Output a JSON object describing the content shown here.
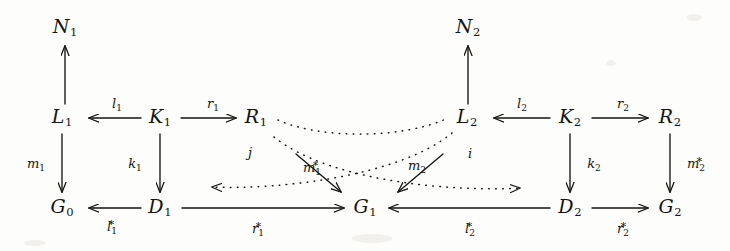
{
  "diagram": {
    "type": "commutative-diagram",
    "title": "",
    "nodes": [
      {
        "id": "N1",
        "label": "N",
        "sub": "1",
        "x": 65,
        "y": 28
      },
      {
        "id": "N2",
        "label": "N",
        "sub": "2",
        "x": 468,
        "y": 28
      },
      {
        "id": "L1",
        "label": "L",
        "sub": "1",
        "x": 62,
        "y": 118
      },
      {
        "id": "K1",
        "label": "K",
        "sub": "1",
        "x": 160,
        "y": 118
      },
      {
        "id": "R1",
        "label": "R",
        "sub": "1",
        "x": 256,
        "y": 118
      },
      {
        "id": "L2",
        "label": "L",
        "sub": "2",
        "x": 467,
        "y": 118
      },
      {
        "id": "K2",
        "label": "K",
        "sub": "2",
        "x": 570,
        "y": 118
      },
      {
        "id": "R2",
        "label": "R",
        "sub": "2",
        "x": 670,
        "y": 118
      },
      {
        "id": "G0",
        "label": "G",
        "sub": "0",
        "x": 62,
        "y": 208
      },
      {
        "id": "D1",
        "label": "D",
        "sub": "1",
        "x": 160,
        "y": 208
      },
      {
        "id": "G1",
        "label": "G",
        "sub": "1",
        "x": 365,
        "y": 208
      },
      {
        "id": "D2",
        "label": "D",
        "sub": "2",
        "x": 570,
        "y": 208
      },
      {
        "id": "G2",
        "label": "G",
        "sub": "2",
        "x": 670,
        "y": 208
      }
    ],
    "edges": [
      {
        "id": "L1-N1",
        "from": "L1",
        "to": "N1",
        "style": "solid",
        "label": "",
        "sub": "",
        "star": false
      },
      {
        "id": "L2-N2",
        "from": "L2",
        "to": "N2",
        "style": "solid",
        "label": "",
        "sub": "",
        "star": false
      },
      {
        "id": "K1-L1",
        "from": "K1",
        "to": "L1",
        "style": "solid",
        "label": "l",
        "sub": "1",
        "star": false
      },
      {
        "id": "K1-R1",
        "from": "K1",
        "to": "R1",
        "style": "solid",
        "label": "r",
        "sub": "1",
        "star": false
      },
      {
        "id": "K2-L2",
        "from": "K2",
        "to": "L2",
        "style": "solid",
        "label": "l",
        "sub": "2",
        "star": false
      },
      {
        "id": "K2-R2",
        "from": "K2",
        "to": "R2",
        "style": "solid",
        "label": "r",
        "sub": "2",
        "star": false
      },
      {
        "id": "L1-G0",
        "from": "L1",
        "to": "G0",
        "style": "solid",
        "label": "m",
        "sub": "1",
        "star": false
      },
      {
        "id": "K1-D1",
        "from": "K1",
        "to": "D1",
        "style": "solid",
        "label": "k",
        "sub": "1",
        "star": false
      },
      {
        "id": "K2-D2",
        "from": "K2",
        "to": "D2",
        "style": "solid",
        "label": "k",
        "sub": "2",
        "star": false
      },
      {
        "id": "R2-G2",
        "from": "R2",
        "to": "G2",
        "style": "solid",
        "label": "m",
        "sub": "2",
        "star": true
      },
      {
        "id": "D1-G0",
        "from": "D1",
        "to": "G0",
        "style": "solid",
        "label": "l",
        "sub": "1",
        "star": true
      },
      {
        "id": "D1-G1",
        "from": "D1",
        "to": "G1",
        "style": "solid",
        "label": "r",
        "sub": "1",
        "star": true
      },
      {
        "id": "D2-G1",
        "from": "D2",
        "to": "G1",
        "style": "solid",
        "label": "l",
        "sub": "2",
        "star": true
      },
      {
        "id": "D2-G2",
        "from": "D2",
        "to": "G2",
        "style": "solid",
        "label": "r",
        "sub": "2",
        "star": true
      },
      {
        "id": "R1-G1",
        "from": "R1",
        "to": "G1",
        "style": "solid",
        "label": "m",
        "sub": "1",
        "star": true
      },
      {
        "id": "L2-G1",
        "from": "L2",
        "to": "G1",
        "style": "solid",
        "label": "m",
        "sub": "2",
        "star": false
      },
      {
        "id": "R1-L2",
        "from": "R1",
        "to": "L2",
        "style": "dotted",
        "label": "",
        "sub": "",
        "star": false
      },
      {
        "id": "L2-D1",
        "from": "L2",
        "to": "D1",
        "style": "dotted",
        "label": "j",
        "sub": "",
        "star": false
      },
      {
        "id": "R1-D2",
        "from": "R1",
        "to": "D2",
        "style": "dotted",
        "label": "i",
        "sub": "",
        "star": false
      }
    ],
    "edge_labels": [
      {
        "id": "lbl-l1",
        "text": "l",
        "sub": "1",
        "star": false,
        "x": 117,
        "y": 105
      },
      {
        "id": "lbl-r1",
        "text": "r",
        "sub": "1",
        "star": false,
        "x": 213,
        "y": 105
      },
      {
        "id": "lbl-l2",
        "text": "l",
        "sub": "2",
        "star": false,
        "x": 522,
        "y": 105
      },
      {
        "id": "lbl-r2",
        "text": "r",
        "sub": "2",
        "star": false,
        "x": 623,
        "y": 105
      },
      {
        "id": "lbl-m1",
        "text": "m",
        "sub": "1",
        "star": false,
        "x": 36,
        "y": 165
      },
      {
        "id": "lbl-k1",
        "text": "k",
        "sub": "1",
        "star": false,
        "x": 135,
        "y": 165
      },
      {
        "id": "lbl-k2",
        "text": "k",
        "sub": "2",
        "star": false,
        "x": 594,
        "y": 165
      },
      {
        "id": "lbl-m2s",
        "text": "m",
        "sub": "2",
        "star": true,
        "x": 696,
        "y": 163
      },
      {
        "id": "lbl-l1s",
        "text": "l",
        "sub": "1",
        "star": true,
        "x": 112,
        "y": 226
      },
      {
        "id": "lbl-r1s",
        "text": "r",
        "sub": "1",
        "star": true,
        "x": 258,
        "y": 228
      },
      {
        "id": "lbl-l2s",
        "text": "l",
        "sub": "2",
        "star": true,
        "x": 470,
        "y": 228
      },
      {
        "id": "lbl-r2s",
        "text": "r",
        "sub": "2",
        "star": true,
        "x": 623,
        "y": 228
      },
      {
        "id": "lbl-m1s",
        "text": "m",
        "sub": "1",
        "star": true,
        "x": 312,
        "y": 167
      },
      {
        "id": "lbl-m2",
        "text": "m",
        "sub": "2",
        "star": false,
        "x": 417,
        "y": 167
      },
      {
        "id": "lbl-j",
        "text": "j",
        "sub": "",
        "star": false,
        "x": 250,
        "y": 152
      },
      {
        "id": "lbl-i",
        "text": "i",
        "sub": "",
        "star": false,
        "x": 470,
        "y": 153
      }
    ],
    "colors": {
      "ink": "#15130f",
      "paper": "#fdfdfb"
    }
  }
}
